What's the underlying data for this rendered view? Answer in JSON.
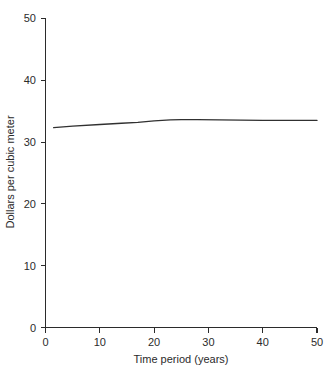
{
  "chart_data": {
    "type": "line",
    "title": "",
    "subtitle": "",
    "xlabel": "Time period (years)",
    "ylabel": "Dollars per cubic meter",
    "xlim": [
      0,
      50
    ],
    "ylim": [
      0,
      50
    ],
    "xticks": [
      0,
      10,
      20,
      30,
      40,
      50
    ],
    "yticks": [
      0,
      10,
      20,
      30,
      40,
      50
    ],
    "xtick_labels": [
      "0",
      "10",
      "20",
      "30",
      "40",
      "50"
    ],
    "ytick_labels": [
      "0",
      "10",
      "20",
      "30",
      "40",
      "50"
    ],
    "grid": false,
    "legend": false,
    "legend_position": "none",
    "annotations": [],
    "series": [
      {
        "name": "Dollars per cubic meter",
        "color": "#303030",
        "x": [
          1.5,
          5,
          10,
          14,
          17,
          20,
          23,
          25,
          28,
          32,
          36,
          40,
          45,
          50
        ],
        "values": [
          32.35,
          32.6,
          32.85,
          33.05,
          33.2,
          33.45,
          33.6,
          33.65,
          33.65,
          33.6,
          33.55,
          33.5,
          33.5,
          33.5
        ]
      }
    ]
  },
  "axis": {
    "y_label": "Dollars per cubic meter",
    "x_label": "Time period (years)",
    "y_tick_0": "0",
    "y_tick_10": "10",
    "y_tick_20": "20",
    "y_tick_30": "30",
    "y_tick_40": "40",
    "y_tick_50": "50",
    "x_tick_0": "0",
    "x_tick_10": "10",
    "x_tick_20": "20",
    "x_tick_30": "30",
    "x_tick_40": "40",
    "x_tick_50": "50"
  }
}
